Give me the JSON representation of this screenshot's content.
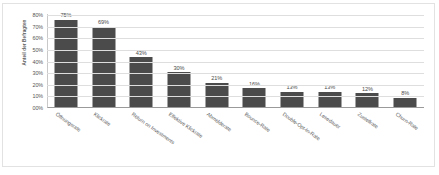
{
  "chart_data": {
    "type": "bar",
    "title": "",
    "subtitle": "",
    "xlabel": "",
    "ylabel": "Anteil der Befragten",
    "ylim": [
      0,
      80
    ],
    "ytick_labels": [
      "80%",
      "70%",
      "60%",
      "50%",
      "40%",
      "30%",
      "20%",
      "10%",
      "00%"
    ],
    "ytick_values": [
      80,
      70,
      60,
      50,
      40,
      30,
      20,
      10,
      0
    ],
    "grid": true,
    "legend": "none",
    "bar_color": "#4b4b4b",
    "categories": [
      "Öffnungsrate",
      "Klickrate",
      "Return on Investments",
      "Effektive Klickrate",
      "Abmelderate",
      "Bounce-Rate",
      "Double-Opt-In-Rate",
      "Lesedauer",
      "Zustellrate",
      "Churn-Rate"
    ],
    "values": [
      75,
      69,
      43,
      30,
      21,
      16,
      13,
      13,
      12,
      8
    ],
    "data_labels": [
      "75%",
      "69%",
      "43%",
      "30%",
      "21%",
      "16%",
      "13%",
      "13%",
      "12%",
      "8%"
    ]
  }
}
